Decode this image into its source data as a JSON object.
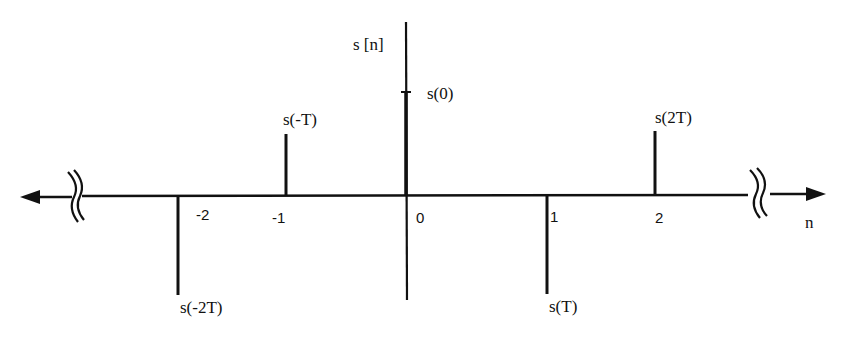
{
  "diagram": {
    "vertical_axis_label": "s [n]",
    "horizontal_axis_label": "n",
    "ink_color": "#111111",
    "background": "#ffffff",
    "axis_breaks": [
      "left-break",
      "right-break"
    ],
    "samples": [
      {
        "n": "-2",
        "label": "s(-2T)",
        "direction": "down"
      },
      {
        "n": "-1",
        "label": "s(-T)",
        "direction": "up"
      },
      {
        "n": "0",
        "label": "s(0)",
        "direction": "up"
      },
      {
        "n": "1",
        "label": "s(T)",
        "direction": "down"
      },
      {
        "n": "2",
        "label": "s(2T)",
        "direction": "up"
      }
    ]
  }
}
